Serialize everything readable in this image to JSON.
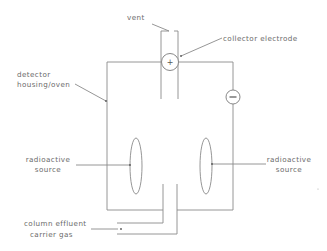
{
  "diagram": {
    "type": "electron capture detector schematic",
    "labels": {
      "vent": "vent",
      "collector_electrode": "collector electrode",
      "housing_line1": "detector",
      "housing_line2": "housing/oven",
      "source_left_line1": "radioactive",
      "source_left_line2": "source",
      "source_right_line1": "radioactive",
      "source_right_line2": "source",
      "inlet_line1": "column effluent",
      "inlet_line2": "carrier gas"
    },
    "symbols": {
      "positive": "+",
      "negative": "−"
    },
    "colors": {
      "line": "#8a8a8a",
      "text": "#6a6a6a",
      "background": "#ffffff"
    }
  }
}
